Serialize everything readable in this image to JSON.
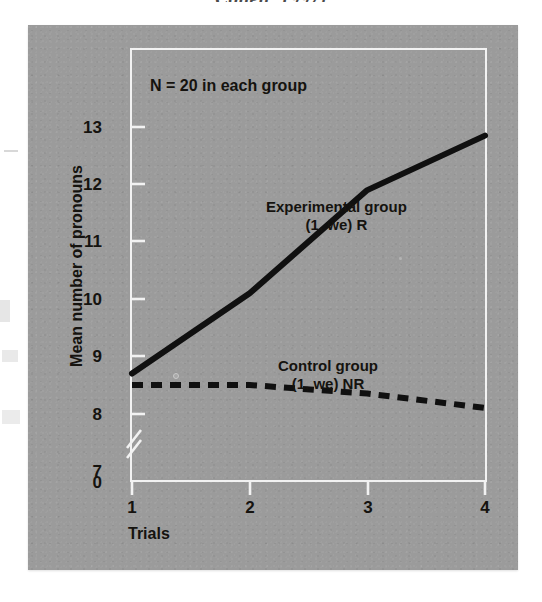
{
  "page": {
    "top_caption": "Cohen, 1997)"
  },
  "figure": {
    "note": "N = 20 in each group",
    "panel_color": "#9b9b9b",
    "axis_color": "#f2f2f2",
    "data_color": "#101010"
  },
  "axes": {
    "y_title": "Mean number of pronouns",
    "x_title": "Trials",
    "y_ticks": [
      "0",
      "7",
      "8",
      "9",
      "10",
      "11",
      "12",
      "13"
    ],
    "x_ticks": [
      "1",
      "2",
      "3",
      "4"
    ],
    "y_zero_label": "0",
    "has_axis_break": true
  },
  "series_labels": {
    "experimental": {
      "line1": "Experimental group",
      "line2": "(1, we) R"
    },
    "control": {
      "line1": "Control group",
      "line2": "(1, we) NR"
    }
  },
  "chart_data": {
    "type": "line",
    "title": "",
    "xlabel": "Trials",
    "ylabel": "Mean number of pronouns",
    "x": [
      1,
      2,
      3,
      4
    ],
    "xlim": [
      1,
      4
    ],
    "ylim": [
      7,
      13
    ],
    "ytick_values": [
      7,
      8,
      9,
      10,
      11,
      12,
      13
    ],
    "y_axis_break_below": 7,
    "y_zero_shown": true,
    "grid": false,
    "legend": "in-plot annotations",
    "annotations": [
      "N = 20 in each group"
    ],
    "series": [
      {
        "name": "Experimental group (1, we) R",
        "style": "solid",
        "color": "#101010",
        "values": [
          8.7,
          10.1,
          11.9,
          12.85
        ]
      },
      {
        "name": "Control group (1, we) NR",
        "style": "dashed",
        "color": "#101010",
        "values": [
          8.5,
          8.5,
          8.35,
          8.1
        ]
      }
    ]
  }
}
